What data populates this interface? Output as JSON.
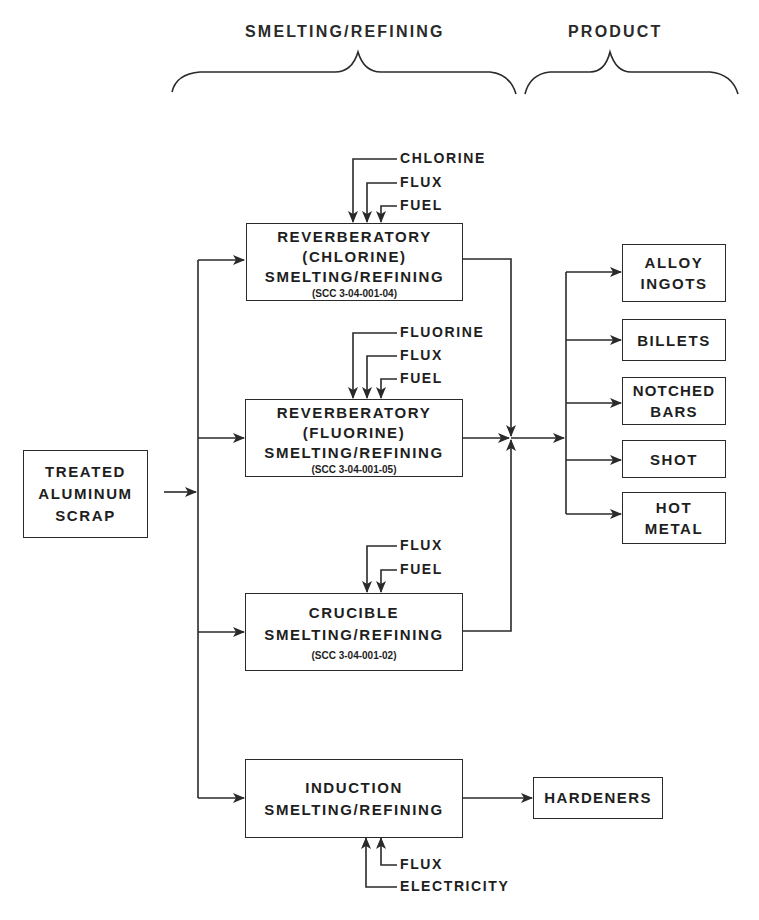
{
  "headers": {
    "smelting_refining": "SMELTING/REFINING",
    "product": "PRODUCT"
  },
  "feed": {
    "lines": [
      "TREATED",
      "ALUMINUM",
      "SCRAP"
    ]
  },
  "processes": [
    {
      "id": "reverb-chlorine",
      "lines": [
        "REVERBERATORY",
        "(CHLORINE)",
        "SMELTING/REFINING"
      ],
      "scc": "(SCC 3-04-001-04)",
      "inputs": [
        "CHLORINE",
        "FLUX",
        "FUEL"
      ]
    },
    {
      "id": "reverb-fluorine",
      "lines": [
        "REVERBERATORY",
        "(FLUORINE)",
        "SMELTING/REFINING"
      ],
      "scc": "(SCC 3-04-001-05)",
      "inputs": [
        "FLUORINE",
        "FLUX",
        "FUEL"
      ]
    },
    {
      "id": "crucible",
      "lines": [
        "CRUCIBLE",
        "SMELTING/REFINING"
      ],
      "scc": "(SCC 3-04-001-02)",
      "inputs": [
        "FLUX",
        "FUEL"
      ]
    },
    {
      "id": "induction",
      "lines": [
        "INDUCTION",
        "SMELTING/REFINING"
      ],
      "scc": "",
      "inputs": [
        "FLUX",
        "ELECTRICITY"
      ]
    }
  ],
  "products": [
    {
      "lines": [
        "ALLOY",
        "INGOTS"
      ]
    },
    {
      "lines": [
        "BILLETS"
      ]
    },
    {
      "lines": [
        "NOTCHED",
        "BARS"
      ]
    },
    {
      "lines": [
        "SHOT"
      ]
    },
    {
      "lines": [
        "HOT",
        "METAL"
      ]
    }
  ],
  "induction_product": "HARDENERS",
  "colors": {
    "line": "#2a2a2a",
    "background": "#ffffff"
  }
}
